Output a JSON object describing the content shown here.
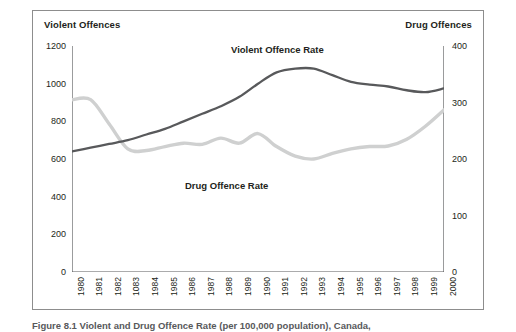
{
  "figure": {
    "caption": "Figure 8.1  Violent and Drug Offence Rate (per 100,000 population), Canada,"
  },
  "axes": {
    "left_title": "Violent Offences",
    "right_title": "Drug Offences",
    "left_ticks": [
      "0",
      "200",
      "400",
      "600",
      "800",
      "1000",
      "1200"
    ],
    "right_ticks": [
      "0",
      "100",
      "200",
      "300",
      "400"
    ]
  },
  "series_labels": {
    "violent": "Violent Offence Rate",
    "drug": "Drug Offence Rate"
  },
  "colors": {
    "violent_line": "#58595b",
    "drug_line": "#cfd0d0",
    "frame": "#8d8d8d",
    "axis": "#58595b",
    "text": "#231f20",
    "caption": "#58595b",
    "background": "#ffffff"
  },
  "chart_data": {
    "type": "line",
    "title": "Violent and Drug Offence Rate (per 100,000 population), Canada",
    "xlabel": "",
    "ylabel": "Violent Offences",
    "y2label": "Drug Offences",
    "grid": false,
    "legend": "in-plot labels",
    "x": [
      1980,
      1981,
      1982,
      1983,
      1984,
      1985,
      1986,
      1987,
      1988,
      1989,
      1990,
      1991,
      1992,
      1993,
      1994,
      1995,
      1996,
      1997,
      1998,
      1999,
      2000
    ],
    "xtick_labels": [
      "1980",
      "1981",
      "1982",
      "1083",
      "1984",
      "1985",
      "1986",
      "1987",
      "1988",
      "1989",
      "1990",
      "1991",
      "1992",
      "1993",
      "1994",
      "1995",
      "1996",
      "1997",
      "1998",
      "1999",
      "2000"
    ],
    "ylim": [
      0,
      1200
    ],
    "y2lim": [
      0,
      400
    ],
    "series": [
      {
        "name": "Violent Offence Rate",
        "axis": "left",
        "color": "#58595b",
        "values": [
          640,
          660,
          680,
          700,
          730,
          760,
          800,
          840,
          880,
          930,
          1000,
          1060,
          1080,
          1080,
          1045,
          1010,
          995,
          985,
          965,
          955,
          975
        ]
      },
      {
        "name": "Drug Offence Rate",
        "axis": "right",
        "color": "#cfd0d0",
        "values": [
          305,
          305,
          262,
          218,
          215,
          222,
          228,
          226,
          237,
          228,
          245,
          222,
          205,
          200,
          210,
          218,
          222,
          223,
          235,
          258,
          287
        ]
      }
    ]
  }
}
